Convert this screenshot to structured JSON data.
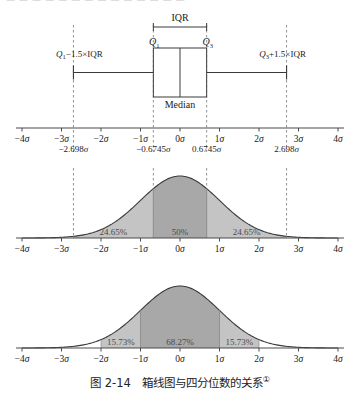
{
  "bleed_text": "— — — — — — — — — — — — — —",
  "caption": {
    "number": "图 2-14",
    "title": "箱线图与四分位数的关系",
    "footnote_marker": "①"
  },
  "boxplot": {
    "iqr_label": "IQR",
    "q1_label": "Q",
    "q1_sub": "1",
    "q3_label": "Q",
    "q3_sub": "3",
    "median_label": "Median",
    "lower_fence_label": "Q₁−1.5×IQR",
    "upper_fence_label": "Q₃+1.5×IQR",
    "q1_sigma": -0.6745,
    "q3_sigma": 0.6745,
    "median_sigma": 0,
    "lower_fence_sigma": -2.698,
    "upper_fence_sigma": 2.698
  },
  "axis": {
    "ticks": [
      "-4σ",
      "-3σ",
      "-2σ",
      "-1σ",
      "0σ",
      "1σ",
      "2σ",
      "3σ",
      "4σ"
    ],
    "tick_values": [
      -4,
      -3,
      -2,
      -1,
      0,
      1,
      2,
      3,
      4
    ],
    "min": -4,
    "max": 4
  },
  "quartile_markers": {
    "labels": [
      "−2.698σ",
      "−0.6745σ",
      "0.6745σ",
      "2.698σ"
    ],
    "values": [
      -2.698,
      -0.6745,
      0.6745,
      2.698
    ]
  },
  "colors": {
    "curve_stroke": "#3a3a3a",
    "fill_inner": "#a8a8a8",
    "fill_outer": "#c4c4c4",
    "axis": "#4a4a4a",
    "dashed_guide": "#777777",
    "box_stroke": "#3a3a3a"
  },
  "chart_data": [
    {
      "type": "boxplot",
      "title": "",
      "xlabel": "",
      "ylabel": "",
      "xlim": [
        -4,
        4
      ],
      "grid": false,
      "tick_labels": [
        "-4σ",
        "-3σ",
        "-2σ",
        "-1σ",
        "0σ",
        "1σ",
        "2σ",
        "3σ",
        "4σ"
      ],
      "box": {
        "lower_whisker": -2.698,
        "q1": -0.6745,
        "median": 0,
        "q3": 0.6745,
        "upper_whisker": 2.698
      },
      "annotations": [
        "IQR",
        "Q₁",
        "Q₃",
        "Median",
        "Q₁−1.5×IQR",
        "Q₃+1.5×IQR"
      ]
    },
    {
      "type": "area",
      "title": "",
      "subtitle": "Normal curve partitioned at the quartiles",
      "xlabel": "",
      "ylabel": "",
      "xlim": [
        -4,
        4
      ],
      "grid": false,
      "distribution": "standard normal",
      "tick_labels": [
        "-4σ",
        "-3σ",
        "-2σ",
        "-1σ",
        "0σ",
        "1σ",
        "2σ",
        "3σ",
        "4σ"
      ],
      "regions": [
        {
          "label": "24.65%",
          "from": -2.698,
          "to": -0.6745,
          "value": 24.65,
          "shade": "light"
        },
        {
          "label": "50%",
          "from": -0.6745,
          "to": 0.6745,
          "value": 50,
          "shade": "dark"
        },
        {
          "label": "24.65%",
          "from": 0.6745,
          "to": 2.698,
          "value": 24.65,
          "shade": "light"
        }
      ]
    },
    {
      "type": "area",
      "title": "",
      "subtitle": "Normal curve partitioned at ±1σ and ±2σ",
      "xlabel": "",
      "ylabel": "",
      "xlim": [
        -4,
        4
      ],
      "grid": false,
      "distribution": "standard normal",
      "tick_labels": [
        "-4σ",
        "-3σ",
        "-2σ",
        "-1σ",
        "0σ",
        "1σ",
        "2σ",
        "3σ",
        "4σ"
      ],
      "regions": [
        {
          "label": "15.73%",
          "from": -2,
          "to": -1,
          "value": 15.73,
          "shade": "light"
        },
        {
          "label": "68.27%",
          "from": -1,
          "to": 1,
          "value": 68.27,
          "shade": "dark"
        },
        {
          "label": "15.73%",
          "from": 1,
          "to": 2,
          "value": 15.73,
          "shade": "light"
        }
      ]
    }
  ]
}
